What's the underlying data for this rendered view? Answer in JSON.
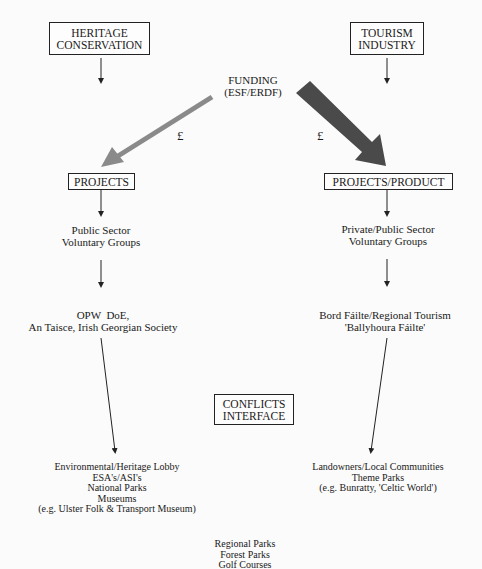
{
  "diagram": {
    "left_column": {
      "top_box": [
        "HERITAGE",
        "CONSERVATION"
      ],
      "projects_box": "PROJECTS",
      "actors": [
        "Public Sector",
        "Voluntary Groups"
      ],
      "agencies": [
        "OPW  DoE,",
        "An Taisce, Irish Georgian Society"
      ],
      "outcomes": [
        "Environmental/Heritage Lobby",
        "ESA's/ASI's",
        "National Parks",
        "Museums",
        "(e.g. Ulster Folk & Transport Museum)"
      ]
    },
    "right_column": {
      "top_box": [
        "TOURISM",
        "INDUSTRY"
      ],
      "projects_box": "PROJECTS/PRODUCT",
      "actors": [
        "Private/Public Sector",
        "Voluntary Groups"
      ],
      "agencies": [
        "Bord Fáilte/Regional Tourism",
        "'Ballyhoura Fáilte'"
      ],
      "outcomes": [
        "Landowners/Local Communities",
        "Theme Parks",
        "(e.g. Bunratty, 'Celtic World')"
      ]
    },
    "center": {
      "funding": [
        "FUNDING",
        "(ESF/ERDF)"
      ],
      "pound_left": "£",
      "pound_right": "£",
      "conflicts_box": [
        "CONFLICTS",
        "INTERFACE"
      ],
      "shared_outcomes": [
        "Regional Parks",
        "Forest Parks",
        "Golf Courses"
      ]
    },
    "colors": {
      "thin_arrow": "#222222",
      "left_funding_arrow": "#8a8a8a",
      "right_funding_arrow": "#4a4a4a"
    }
  }
}
